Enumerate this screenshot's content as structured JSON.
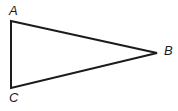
{
  "figure": {
    "kind": "geometry-diagram",
    "shape": "triangle",
    "background_color": "#ffffff",
    "stroke_color": "#1b1b1b",
    "stroke_width": 2,
    "label_color": "#1b1b1b",
    "canvas": {
      "width": 178,
      "height": 111
    },
    "vertices": [
      {
        "id": "A",
        "label": "A",
        "x": 11,
        "y": 21,
        "label_x": 9,
        "label_y": 4
      },
      {
        "id": "B",
        "label": "B",
        "x": 157,
        "y": 53,
        "label_x": 164,
        "label_y": 44
      },
      {
        "id": "C",
        "label": "C",
        "x": 11,
        "y": 88,
        "label_x": 9,
        "label_y": 91
      }
    ],
    "edges": [
      {
        "id": "AB",
        "from": "A",
        "to": "B"
      },
      {
        "id": "BC",
        "from": "B",
        "to": "C"
      },
      {
        "id": "CA",
        "from": "C",
        "to": "A"
      }
    ],
    "polygon_points": "11,21 157,53 11,88"
  }
}
